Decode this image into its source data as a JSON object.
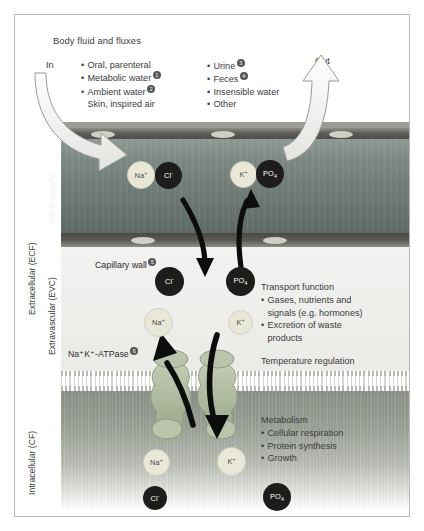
{
  "figure": {
    "title": "Body fluid and fluxes",
    "in_label": "In",
    "out_label": "Out",
    "intake": {
      "items": [
        "Oral, parenteral",
        "Metabolic water",
        "Ambient water",
        "Skin, inspired air"
      ],
      "markers": [
        "",
        "1",
        "2",
        ""
      ]
    },
    "output": {
      "items": [
        "Urine",
        "Feces",
        "Insensible water",
        "Other"
      ],
      "markers": [
        "3",
        "4",
        "",
        ""
      ]
    },
    "capillary_wall": {
      "label": "Capillary wall",
      "marker": "5"
    },
    "pump": {
      "label": "Na⁺K⁺-ATPase",
      "marker": "6"
    },
    "transport": {
      "title": "Transport function",
      "items": [
        "Gases, nutrients and",
        "signals (e.g. hormones)",
        "Excretion of waste",
        "products"
      ],
      "bullets": [
        true,
        false,
        true,
        false
      ],
      "footer": "Temperature regulation"
    },
    "metabolism": {
      "title": "Metabolism",
      "items": [
        "Cellular respiration",
        "Protein synthesis",
        "Growth"
      ]
    },
    "axis": {
      "extracellular": "Extracellular (ECF)",
      "intravascular": "Intravascular",
      "extravascular": "Extravascular (EVC)",
      "intracellular": "Intracellular (CF)"
    },
    "ions": {
      "vascular": [
        {
          "name": "Na",
          "charge": "+",
          "sub": "",
          "tone": "lt"
        },
        {
          "name": "Cl",
          "charge": "-",
          "sub": "",
          "tone": "dk"
        },
        {
          "name": "K",
          "charge": "+",
          "sub": "",
          "tone": "lt"
        },
        {
          "name": "PO",
          "charge": "",
          "sub": "4",
          "tone": "dk"
        }
      ],
      "interstitial": [
        {
          "name": "Cl",
          "charge": "-",
          "sub": "",
          "tone": "dk"
        },
        {
          "name": "PO",
          "charge": "",
          "sub": "4",
          "tone": "dk"
        },
        {
          "name": "Na",
          "charge": "+",
          "sub": "",
          "tone": "lt"
        },
        {
          "name": "K",
          "charge": "+",
          "sub": "",
          "tone": "lt"
        }
      ],
      "intracellular": [
        {
          "name": "Na",
          "charge": "+",
          "sub": "",
          "tone": "lt"
        },
        {
          "name": "K",
          "charge": "+",
          "sub": "",
          "tone": "lt"
        },
        {
          "name": "Cl",
          "charge": "-",
          "sub": "",
          "tone": "dk"
        },
        {
          "name": "PO",
          "charge": "",
          "sub": "4",
          "tone": "dk"
        }
      ]
    },
    "colors": {
      "ion_light": "#e9e7d8",
      "ion_dark": "#1d1d1b",
      "lumen": "#6f7c77",
      "endothelium": "#4a4a45",
      "cytoplasm": "#9aa096",
      "pump_protein": "#a9b59a",
      "border": "#b9b9b9",
      "text": "#3b3b3b"
    }
  }
}
